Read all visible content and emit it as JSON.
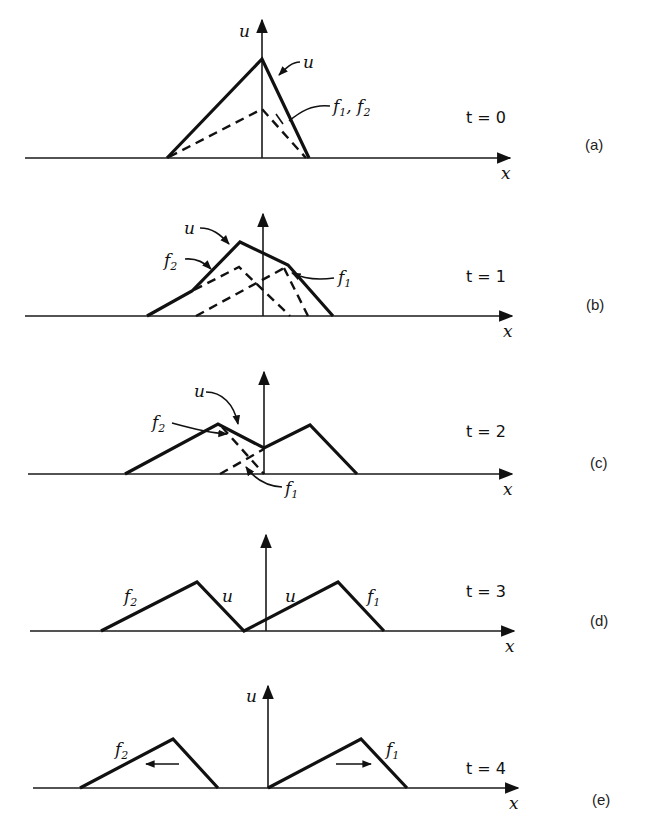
{
  "figure": {
    "axis_labels": {
      "x": "x",
      "u": "u"
    },
    "panels": [
      {
        "id": "a",
        "panel_label": "(a)",
        "time_label": "t = 0",
        "u_axis_label": "u",
        "curve_labels": {
          "u": "u",
          "f1f2": "f1, f2"
        }
      },
      {
        "id": "b",
        "panel_label": "(b)",
        "time_label": "t = 1",
        "curve_labels": {
          "u": "u",
          "f1": "f1",
          "f2": "f2"
        }
      },
      {
        "id": "c",
        "panel_label": "(c)",
        "time_label": "t = 2",
        "curve_labels": {
          "u": "u",
          "f1": "f1",
          "f2": "f2"
        }
      },
      {
        "id": "d",
        "panel_label": "(d)",
        "time_label": "t = 3",
        "curve_labels": {
          "f2": "f2",
          "u_left": "u",
          "u_right": "u",
          "f1": "f1"
        }
      },
      {
        "id": "e",
        "panel_label": "(e)",
        "time_label": "t = 4",
        "u_axis_label": "u",
        "curve_labels": {
          "f2": "f2",
          "f1": "f1"
        },
        "direction_arrows": {
          "f2": "left",
          "f1": "right"
        }
      }
    ]
  },
  "colors": {
    "ink": "#111111",
    "background": "#ffffff"
  }
}
